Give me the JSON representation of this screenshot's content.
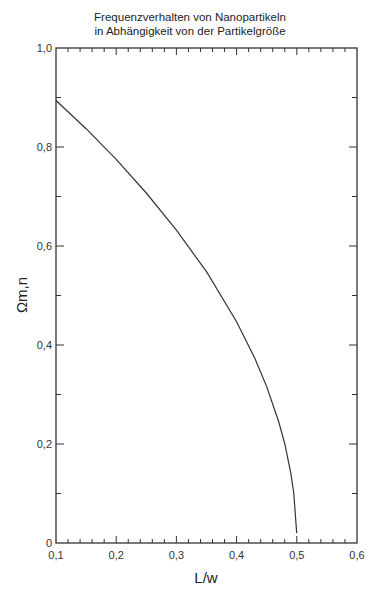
{
  "chart_data": {
    "type": "line",
    "title": "Frequenzverhalten von Nanopartikeln in Abhängigkeit von der Partikelgröße",
    "title_lines": [
      "Frequenzverhalten von Nanopartikeln",
      "in Abhängigkeit von der Partikelgröße"
    ],
    "xlabel": "L/w",
    "ylabel": "Ωm,n",
    "xlim": [
      0.1,
      0.6
    ],
    "ylim": [
      0,
      1.0
    ],
    "x_ticks": [
      "0,1",
      "0,2",
      "0,3",
      "0,4",
      "0,5",
      "0,6"
    ],
    "y_ticks": [
      "0",
      "0,2",
      "0,4",
      "0,6",
      "0,8",
      "1,0"
    ],
    "grid": false,
    "legend": null,
    "series": [
      {
        "name": "Ωm,n",
        "x": [
          0.1,
          0.15,
          0.2,
          0.25,
          0.3,
          0.35,
          0.4,
          0.43,
          0.45,
          0.47,
          0.48,
          0.49,
          0.495,
          0.4998
        ],
        "y": [
          0.894,
          0.837,
          0.775,
          0.707,
          0.632,
          0.548,
          0.447,
          0.374,
          0.316,
          0.245,
          0.2,
          0.141,
          0.1,
          0.02
        ]
      }
    ]
  }
}
